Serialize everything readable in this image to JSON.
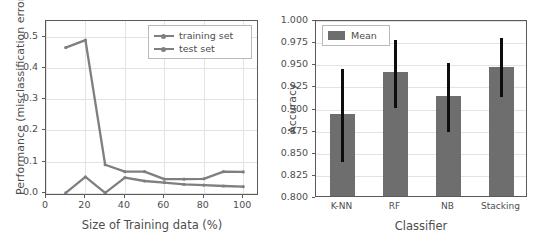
{
  "chart_data": [
    {
      "type": "line",
      "panel": "left",
      "title": "",
      "xlabel": "Size of Training data (%)",
      "ylabel": "Performance (misclassification error)",
      "xlim": [
        0,
        108
      ],
      "ylim": [
        -0.01,
        0.55
      ],
      "xticks": [
        0,
        20,
        40,
        60,
        80,
        100
      ],
      "xticklabels": [
        "0",
        "20",
        "40",
        "60",
        "80",
        "100"
      ],
      "yticks": [
        0.0,
        0.1,
        0.2,
        0.3,
        0.4,
        0.5
      ],
      "yticklabels": [
        "0.0",
        "0.1",
        "0.2",
        "0.3",
        "0.4",
        "0.5"
      ],
      "grid": true,
      "legend_position": "upper right",
      "x": [
        10,
        20,
        30,
        40,
        50,
        60,
        70,
        80,
        90,
        100
      ],
      "series": [
        {
          "name": "training set",
          "color": "#7f7f7f",
          "values": [
            0.0,
            0.051,
            0.0,
            0.049,
            0.038,
            0.033,
            0.027,
            0.025,
            0.022,
            0.02
          ]
        },
        {
          "name": "test set",
          "color": "#7f7f7f",
          "values": [
            0.465,
            0.489,
            0.09,
            0.068,
            0.068,
            0.044,
            0.044,
            0.045,
            0.068,
            0.067
          ]
        }
      ]
    },
    {
      "type": "bar",
      "panel": "right",
      "title": "",
      "xlabel": "Classifier",
      "ylabel": "Accuracy",
      "ylim": [
        0.8,
        1.0
      ],
      "yticks": [
        0.8,
        0.825,
        0.85,
        0.875,
        0.9,
        0.925,
        0.95,
        0.975,
        1.0
      ],
      "yticklabels": [
        "0.800",
        "0.825",
        "0.850",
        "0.875",
        "0.900",
        "0.925",
        "0.950",
        "0.975",
        "1.000"
      ],
      "grid": true,
      "legend_position": "upper left",
      "legend_label": "Mean",
      "bar_color": "#6e6e6e",
      "error_color": "#0d0d0d",
      "categories": [
        "K-NN",
        "RF",
        "NB",
        "Stacking"
      ],
      "values": [
        0.893,
        0.94,
        0.913,
        0.946
      ],
      "error_low": [
        0.841,
        0.902,
        0.874,
        0.914
      ],
      "error_high": [
        0.946,
        0.979,
        0.953,
        0.981
      ]
    }
  ]
}
